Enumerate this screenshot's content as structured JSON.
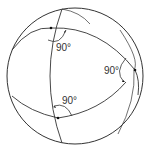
{
  "diagram": {
    "angles": [
      {
        "label": "90°",
        "position": "top-left"
      },
      {
        "label": "90°",
        "position": "right"
      },
      {
        "label": "90°",
        "position": "bottom"
      }
    ],
    "colors": {
      "stroke": "#333333",
      "background": "#ffffff"
    }
  }
}
